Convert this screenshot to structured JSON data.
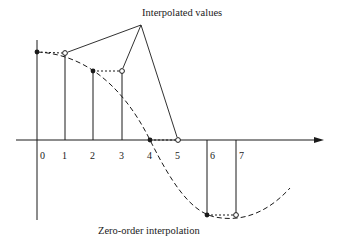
{
  "labels": {
    "top": "Interpolated values",
    "bottom": "Zero-order interpolation"
  },
  "ticks": [
    "0",
    "1",
    "2",
    "3",
    "4",
    "5",
    "6",
    "7"
  ],
  "colors": {
    "ink": "#1a1a1a",
    "background": "#ffffff"
  },
  "samples": [
    {
      "n": 0,
      "type": "sample",
      "marker": "filled"
    },
    {
      "n": 1,
      "type": "interpolated",
      "marker": "open"
    },
    {
      "n": 2,
      "type": "sample",
      "marker": "filled"
    },
    {
      "n": 3,
      "type": "interpolated",
      "marker": "open"
    },
    {
      "n": 4,
      "type": "sample",
      "marker": "filled"
    },
    {
      "n": 5,
      "type": "interpolated",
      "marker": "open"
    },
    {
      "n": 6,
      "type": "sample",
      "marker": "filled"
    },
    {
      "n": 7,
      "type": "interpolated",
      "marker": "open"
    }
  ]
}
